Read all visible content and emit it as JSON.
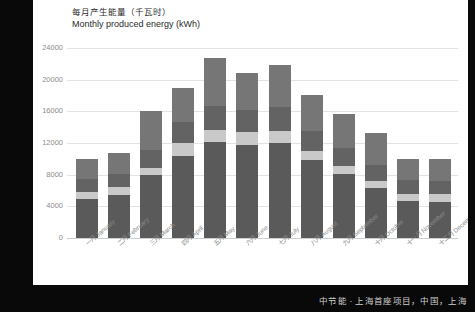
{
  "chart": {
    "title_cn": "每月产生能量（千瓦时）",
    "title_en": "Monthly produced energy (kWh)"
  },
  "caption": "中节能 · 上海首座项目，中国，上海",
  "chart_data": {
    "type": "bar",
    "stacked": true,
    "xlabel": "",
    "ylabel": "",
    "ylim": [
      0,
      24000
    ],
    "yticks": [
      0,
      4000,
      8000,
      12000,
      16000,
      20000,
      24000
    ],
    "ytick_labels": [
      "0",
      "4000",
      "8000",
      "12000",
      "16000",
      "20000",
      "24000"
    ],
    "grid": true,
    "legend": "none",
    "categories": [
      "一月 January",
      "二月 February",
      "三月 March",
      "四月 April",
      "五月 May",
      "六月 June",
      "七月 July",
      "八月 August",
      "九月 September",
      "十月 October",
      "十一月 November",
      "十二月 December"
    ],
    "series": [
      {
        "name": "segment-1",
        "color": "#5a5a5a",
        "values": [
          4900,
          5400,
          8000,
          10400,
          12100,
          11700,
          12000,
          9800,
          8100,
          6300,
          4700,
          4600
        ]
      },
      {
        "name": "segment-2",
        "color": "#c9c9c9",
        "values": [
          900,
          1000,
          900,
          1600,
          1600,
          1700,
          1500,
          1200,
          1000,
          900,
          900,
          900
        ]
      },
      {
        "name": "segment-3",
        "color": "#636363",
        "values": [
          1600,
          1700,
          2200,
          2600,
          3000,
          2800,
          3000,
          2500,
          2300,
          2000,
          1700,
          1700
        ]
      },
      {
        "name": "segment-4",
        "color": "#767676",
        "values": [
          2600,
          2700,
          4900,
          4400,
          6100,
          4600,
          5400,
          4600,
          4300,
          4100,
          2700,
          2800
        ]
      }
    ],
    "totals": [
      10000,
      10800,
      16000,
      19000,
      22800,
      20800,
      21900,
      18100,
      15700,
      13300,
      10000,
      10000
    ]
  }
}
